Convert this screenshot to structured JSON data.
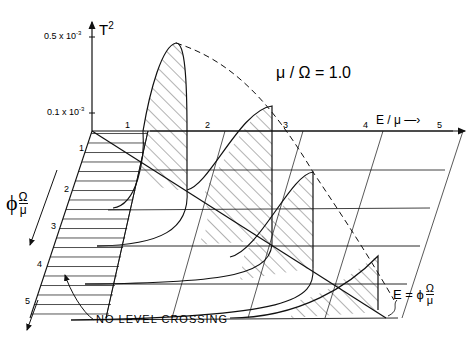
{
  "figure": {
    "parameter_label": "μ / Ω = 1.0",
    "vertical_axis": {
      "label": "T",
      "label_superscript": "2",
      "ticks": [
        {
          "label": "0.5 x 10",
          "exponent": "-3"
        },
        {
          "label": "0.1 x 10",
          "exponent": "-3"
        }
      ]
    },
    "horizontal_axis": {
      "label": "E / μ",
      "ticks": [
        "1",
        "2",
        "3",
        "4",
        "5"
      ]
    },
    "depth_axis": {
      "label_symbol": "ϕ",
      "label_num": "Ω",
      "label_den": "μ",
      "ticks": [
        "1",
        "2",
        "3",
        "4",
        "5"
      ]
    },
    "diagonal_label": {
      "prefix": "E = ϕ",
      "num": "Ω",
      "den": "μ"
    },
    "annotation": "NO LEVEL CROSSING",
    "colors": {
      "ink": "#111111",
      "background": "#ffffff"
    }
  }
}
